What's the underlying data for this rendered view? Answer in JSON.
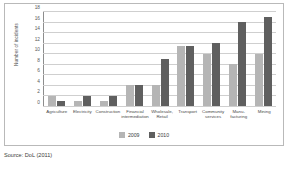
{
  "source_note": "Source: DoL (2011)",
  "legend": {
    "position": "bottom-center",
    "entries": [
      {
        "label": "2009",
        "color": "#b5b5b5"
      },
      {
        "label": "2010",
        "color": "#5f5f5f"
      }
    ]
  },
  "chart_data": {
    "type": "bar",
    "title": "",
    "subtitle": "",
    "xlabel": "",
    "ylabel": "Number of incidents",
    "ylim": [
      0,
      18
    ],
    "yticks": [
      0,
      2,
      4,
      6,
      8,
      10,
      12,
      14,
      16,
      18
    ],
    "ytick_labels": [
      "0",
      "2",
      "4",
      "6",
      "8",
      "10",
      "12",
      "14",
      "16",
      "18"
    ],
    "grid": true,
    "grid_axis": "y",
    "legend_position": "bottom-center",
    "categories": [
      "Agriculture",
      "Electricity",
      "Construction",
      "Financial intermediation",
      "Wholesale, Retail",
      "Transport",
      "Community services",
      "Manu-facturing",
      "Mining"
    ],
    "category_lines": [
      [
        "Agriculture"
      ],
      [
        "Electricity"
      ],
      [
        "Construction"
      ],
      [
        "Financial",
        "intermediation"
      ],
      [
        "Wholesale,",
        "Retail"
      ],
      [
        "Transport"
      ],
      [
        "Community",
        "services"
      ],
      [
        "Manu-",
        "facturing"
      ],
      [
        "Mining"
      ]
    ],
    "series": [
      {
        "name": "2009",
        "color": "#b5b5b5",
        "values": [
          2,
          1,
          1,
          4,
          4,
          11.5,
          10,
          8,
          10
        ]
      },
      {
        "name": "2010",
        "color": "#5f5f5f",
        "values": [
          1,
          2,
          2,
          4,
          9,
          11.5,
          12,
          16,
          17
        ]
      }
    ]
  }
}
